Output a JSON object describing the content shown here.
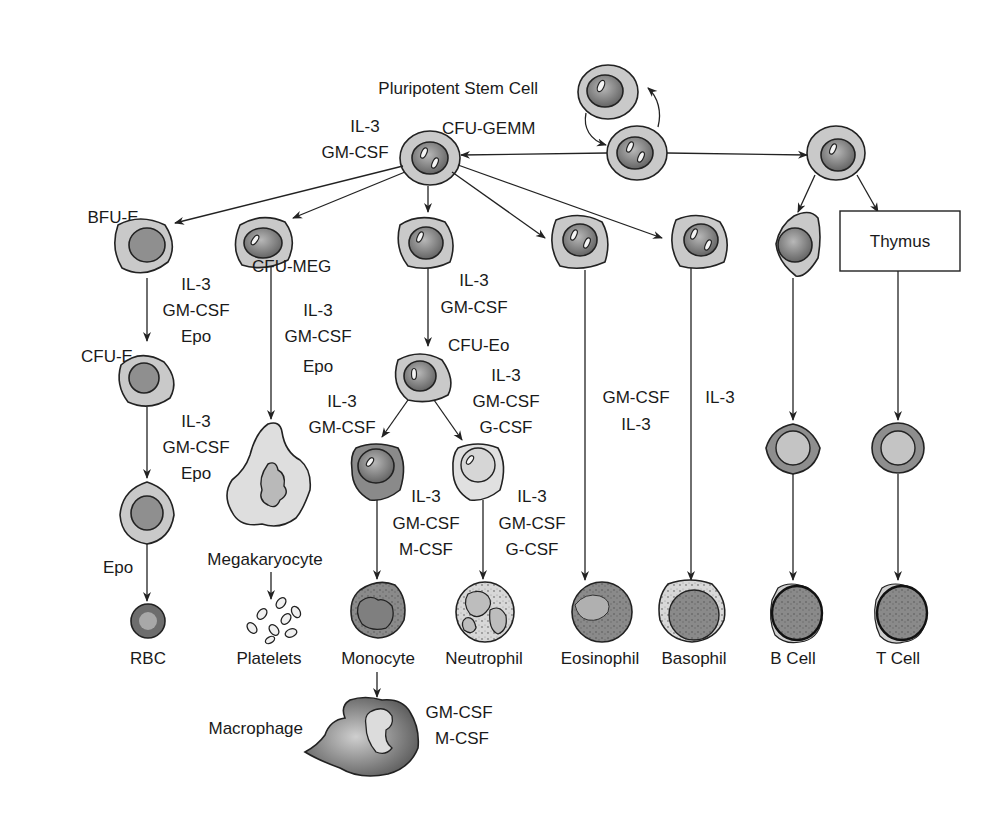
{
  "nodes": {
    "stem_cell": "Pluripotent Stem Cell",
    "cfu_gemm": "CFU-GEMM",
    "bfu_e": "BFU-E",
    "cfu_e": "CFU-E",
    "cfu_meg": "CFU-MEG",
    "cfu_eo": "CFU-Eo",
    "thymus": "Thymus",
    "megakaryocyte": "Megakaryocyte",
    "macrophage": "Macrophage"
  },
  "end_cells": [
    "RBC",
    "Platelets",
    "Monocyte",
    "Neutrophil",
    "Eosinophil",
    "Basophil",
    "B Cell",
    "T Cell"
  ],
  "factors": {
    "gemm": [
      "IL-3",
      "GM-CSF"
    ],
    "bfu_to_cfue": [
      "IL-3",
      "GM-CSF",
      "Epo"
    ],
    "cfue_to_late": [
      "IL-3",
      "GM-CSF",
      "Epo"
    ],
    "late_to_rbc": [
      "Epo"
    ],
    "meg": [
      "IL-3",
      "GM-CSF",
      "Epo"
    ],
    "gm_to_eo": [
      "IL-3",
      "GM-CSF"
    ],
    "to_mono_prog": [
      "IL-3",
      "GM-CSF"
    ],
    "to_neut_prog": [
      "IL-3",
      "GM-CSF",
      "G-CSF"
    ],
    "mono": [
      "IL-3",
      "GM-CSF",
      "M-CSF"
    ],
    "neut": [
      "IL-3",
      "GM-CSF",
      "G-CSF"
    ],
    "eos": [
      "GM-CSF",
      "IL-3"
    ],
    "baso": [
      "IL-3"
    ],
    "macro": [
      "GM-CSF",
      "M-CSF"
    ]
  },
  "colors": {
    "cytoplasm": "#c9c9c9",
    "nucleus": "#7a7a7a",
    "stroke": "#222222",
    "background": "#ffffff"
  }
}
